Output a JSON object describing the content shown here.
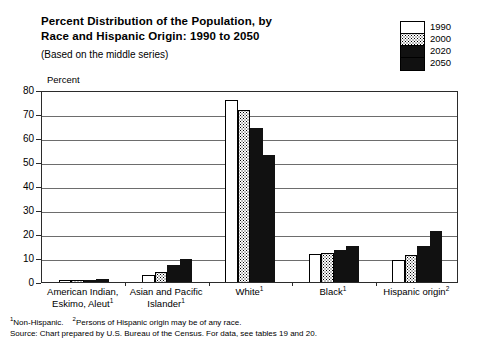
{
  "header": {
    "title_line1": "Percent Distribution of the Population, by",
    "title_line2": "Race and Hispanic Origin:  1990 to 2050",
    "subtitle": "(Based on the middle series)"
  },
  "legend": {
    "entries": [
      {
        "label": "1990",
        "pattern": "solid-white",
        "color": "#ffffff"
      },
      {
        "label": "2000",
        "pattern": "stippled",
        "color": "#ffffff"
      },
      {
        "label": "2020",
        "pattern": "solid-black",
        "color": "#111111"
      },
      {
        "label": "2050",
        "pattern": "solid-black",
        "color": "#111111"
      }
    ]
  },
  "footnotes": {
    "line1_a": "Non-Hispanic.",
    "line1_sup_a": "1",
    "line1_b": "Persons of Hispanic origin may be of any race.",
    "line1_sup_b": "2",
    "line2": "Source: Chart prepared by U.S. Bureau of the Census. For data, see tables 19 and 20."
  },
  "chart_data": {
    "type": "bar",
    "title": "Percent Distribution of the Population, by Race and Hispanic Origin:  1990 to 2050",
    "subtitle": "(Based on the middle series)",
    "xlabel": "",
    "ylabel": "Percent",
    "ylim": [
      0,
      80
    ],
    "yticks": [
      0,
      10,
      20,
      30,
      40,
      50,
      60,
      70,
      80
    ],
    "grid": true,
    "legend_position": "top-right",
    "categories": [
      "American Indian, Eskimo, Aleut¹",
      "Asian and Pacific Islander¹",
      "White¹",
      "Black¹",
      "Hispanic origin²"
    ],
    "category_labels": [
      {
        "line1": "American Indian,",
        "line2": "Eskimo, Aleut",
        "sup": "1"
      },
      {
        "line1": "Asian and Pacific",
        "line2": "Islander",
        "sup": "1"
      },
      {
        "line1": "White",
        "line2": "",
        "sup": "1"
      },
      {
        "line1": "Black",
        "line2": "",
        "sup": "1"
      },
      {
        "line1": "Hispanic origin",
        "line2": "",
        "sup": "2"
      }
    ],
    "series": [
      {
        "name": "1990",
        "values": [
          0.8,
          2.9,
          75.7,
          11.8,
          9.0
        ]
      },
      {
        "name": "2000",
        "values": [
          0.9,
          4.0,
          71.8,
          12.2,
          11.4
        ]
      },
      {
        "name": "2020",
        "values": [
          1.0,
          6.9,
          64.3,
          13.5,
          15.2
        ]
      },
      {
        "name": "2050",
        "values": [
          1.1,
          9.7,
          52.8,
          15.0,
          21.1
        ]
      }
    ]
  }
}
